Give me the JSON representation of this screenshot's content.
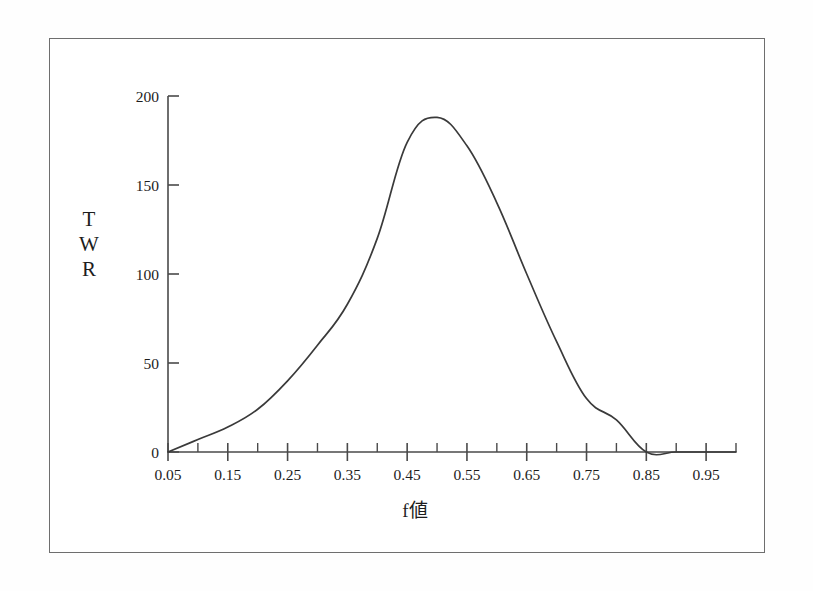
{
  "chart_data": {
    "type": "line",
    "title": "",
    "subtitle": "",
    "xlabel": "f値",
    "ylabel": "TWR",
    "ylabel_stacked": [
      "T",
      "W",
      "R"
    ],
    "xlim": [
      0.05,
      1.0
    ],
    "ylim": [
      0,
      200
    ],
    "grid": false,
    "legend": null,
    "line_color": "#3a3a3a",
    "axis_color": "#4a4a4a",
    "frame_color": "#6e6e6e",
    "x_tick_labels": [
      "0.05",
      "0.15",
      "0.25",
      "0.35",
      "0.45",
      "0.55",
      "0.65",
      "0.75",
      "0.85",
      "0.95"
    ],
    "x_tick_values": [
      0.05,
      0.15,
      0.25,
      0.35,
      0.45,
      0.55,
      0.65,
      0.75,
      0.85,
      0.95
    ],
    "x_minor_tick_values": [
      0.1,
      0.2,
      0.3,
      0.4,
      0.5,
      0.6,
      0.7,
      0.8,
      0.9,
      1.0
    ],
    "y_tick_labels": [
      "0",
      "50",
      "100",
      "150",
      "200"
    ],
    "y_tick_values": [
      0,
      50,
      100,
      150,
      200
    ],
    "series": [
      {
        "name": "TWR",
        "x": [
          0.05,
          0.1,
          0.15,
          0.2,
          0.25,
          0.3,
          0.35,
          0.4,
          0.45,
          0.5,
          0.55,
          0.6,
          0.65,
          0.7,
          0.75,
          0.8,
          0.85,
          0.9,
          0.95,
          1.0
        ],
        "values": [
          0,
          7,
          14,
          24,
          40,
          60,
          83,
          120,
          174,
          188,
          172,
          140,
          100,
          62,
          30,
          18,
          0,
          0,
          0,
          0
        ]
      }
    ],
    "annotations": []
  },
  "figure": {
    "frame_label": "figure-border"
  }
}
